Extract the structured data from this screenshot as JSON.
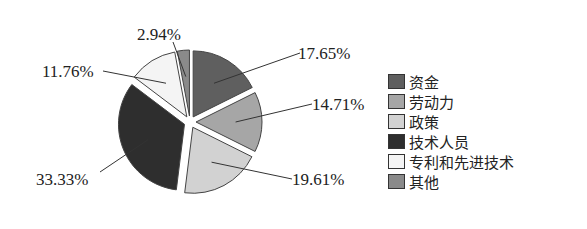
{
  "chart_data": {
    "type": "pie",
    "title": "",
    "categories": [
      "资金",
      "劳动力",
      "政策",
      "技术人员",
      "专利和先进技术",
      "其他"
    ],
    "values": [
      17.65,
      14.71,
      19.61,
      33.33,
      11.76,
      2.94
    ],
    "labels": [
      "17.65%",
      "14.71%",
      "19.61%",
      "33.33%",
      "11.76%",
      "2.94%"
    ],
    "colors": [
      "#5f5f5f",
      "#a6a6a6",
      "#d2d2d2",
      "#2e2e2e",
      "#f4f4f4",
      "#8a8a8a"
    ],
    "legend_position": "right",
    "exploded": true
  },
  "legend": {
    "items": [
      {
        "label": "资金",
        "color": "#5f5f5f"
      },
      {
        "label": "劳动力",
        "color": "#a6a6a6"
      },
      {
        "label": "政策",
        "color": "#d2d2d2"
      },
      {
        "label": "技术人员",
        "color": "#2e2e2e"
      },
      {
        "label": "专利和先进技术",
        "color": "#f4f4f4"
      },
      {
        "label": "其他",
        "color": "#8a8a8a"
      }
    ]
  }
}
